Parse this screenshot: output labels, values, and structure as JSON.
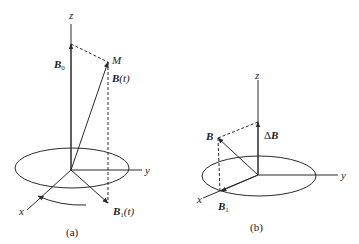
{
  "figure": {
    "panel_a": {
      "caption": "(a)",
      "axes": {
        "z": "z",
        "y": "y",
        "x": "x"
      },
      "labels": {
        "b0": "B",
        "b0_sub": "0",
        "m": "M",
        "bt": "B",
        "bt_arg": "(t)",
        "b1t": "B",
        "b1t_sub": "1",
        "b1t_arg": "(t)"
      }
    },
    "panel_b": {
      "caption": "(b)",
      "axes": {
        "z": "z",
        "y": "y",
        "x": "x"
      },
      "labels": {
        "delta_b_prefix": "Δ",
        "delta_b": "B",
        "b": "B",
        "b1": "B",
        "b1_sub": "1"
      }
    },
    "colors": {
      "line": "#2a2a2a",
      "background": "#ffffff"
    }
  }
}
